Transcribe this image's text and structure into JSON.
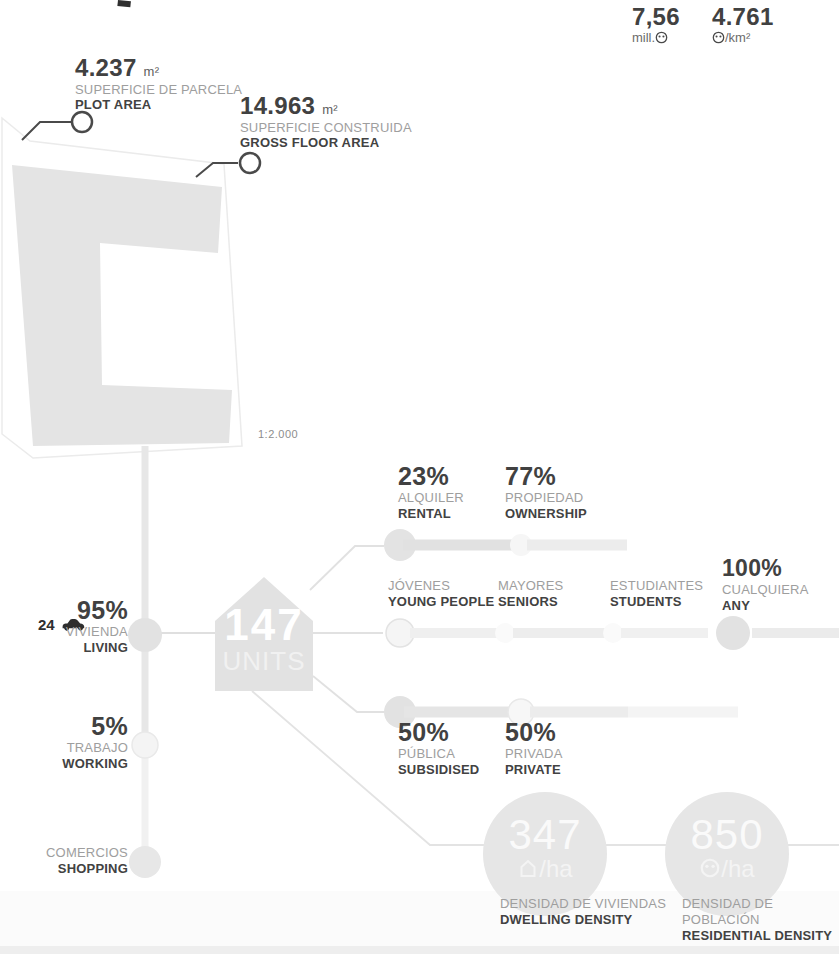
{
  "context_stats": {
    "population": {
      "value": "7,56",
      "unit_prefix": "mill.",
      "icon": "person-icon"
    },
    "city_density": {
      "value": "4.761",
      "unit_suffix": "/km²",
      "icon": "person-icon"
    }
  },
  "callouts": {
    "plot": {
      "value": "4.237",
      "unit": "m²",
      "label_es": "SUPERFICIE DE PARCELA",
      "label_en": "PLOT AREA"
    },
    "gfa": {
      "value": "14.963",
      "unit": "m²",
      "label_es": "SUPERFICIE CONSTRUIDA",
      "label_en": "GROSS FLOOR AREA"
    }
  },
  "plan": {
    "scale": "1:2.000"
  },
  "units_badge": {
    "value": "147",
    "label": "UNITS"
  },
  "parking": {
    "count": "24",
    "icon": "car-icon"
  },
  "program": {
    "living": {
      "value": "95%",
      "label_es": "VIVIENDA",
      "label_en": "LIVING"
    },
    "working": {
      "value": "5%",
      "label_es": "TRABAJO",
      "label_en": "WORKING"
    },
    "shopping": {
      "label_es": "COMERCIOS",
      "label_en": "SHOPPING"
    }
  },
  "tenure": {
    "rental": {
      "value": "23%",
      "label_es": "ALQUILER",
      "label_en": "RENTAL"
    },
    "ownership": {
      "value": "77%",
      "label_es": "PROPIEDAD",
      "label_en": "OWNERSHIP"
    }
  },
  "residents": [
    {
      "label_es": "JÓVENES",
      "label_en": "YOUNG PEOPLE"
    },
    {
      "label_es": "MAYORES",
      "label_en": "SENIORS"
    },
    {
      "label_es": "ESTUDIANTES",
      "label_en": "STUDENTS"
    },
    {
      "value": "100%",
      "label_es": "CUALQUIERA",
      "label_en": "ANY"
    }
  ],
  "funding": {
    "public": {
      "value": "50%",
      "label_es": "PÚBLICA",
      "label_en": "SUBSIDISED"
    },
    "private": {
      "value": "50%",
      "label_es": "PRIVADA",
      "label_en": "PRIVATE"
    }
  },
  "densities": {
    "dwelling": {
      "value": "347",
      "unit": "/ha",
      "icon": "house-icon",
      "label_es": "DENSIDAD DE VIVIENDAS",
      "label_en": "DWELLING DENSITY"
    },
    "residential": {
      "value": "850",
      "unit": "/ha",
      "icon": "person-icon",
      "label_es": "DENSIDAD DE POBLACIÓN",
      "label_en": "RESIDENTIAL DENSITY"
    }
  },
  "colors": {
    "diagram_fill": "#e4e4e4",
    "text_dark": "#3d3d3d",
    "text_gray": "#9e9e9e",
    "leader_stroke": "#4a4a4a",
    "background": "#ffffff"
  }
}
